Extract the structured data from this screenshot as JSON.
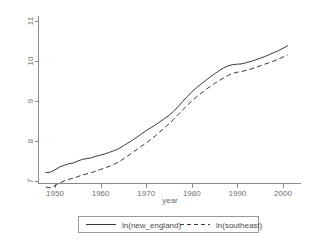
{
  "chart_data": {
    "type": "line",
    "title": "",
    "xlabel": "year",
    "ylabel": "",
    "xlim": [
      1948,
      2002
    ],
    "ylim": [
      6.6,
      11.2
    ],
    "xticks": [
      1950,
      1960,
      1970,
      1980,
      1990,
      2000
    ],
    "xtick_labels": [
      "1950",
      "1960",
      "1970",
      "1980",
      "1990",
      "2000"
    ],
    "yticks": [
      7,
      8,
      9,
      10,
      11
    ],
    "ytick_labels": [
      "7",
      "8",
      "9",
      "10",
      "11"
    ],
    "grid": false,
    "legend_position": "below-plot",
    "legend_entries": [
      {
        "label": "ln(new_england)",
        "style": "solid"
      },
      {
        "label": "ln(southeast)",
        "style": "dashed"
      }
    ],
    "x": [
      1948,
      1949,
      1950,
      1951,
      1952,
      1953,
      1954,
      1955,
      1956,
      1957,
      1958,
      1959,
      1960,
      1961,
      1962,
      1963,
      1964,
      1965,
      1966,
      1967,
      1968,
      1969,
      1970,
      1971,
      1972,
      1973,
      1974,
      1975,
      1976,
      1977,
      1978,
      1979,
      1980,
      1981,
      1982,
      1983,
      1984,
      1985,
      1986,
      1987,
      1988,
      1989,
      1990,
      1991,
      1992,
      1993,
      1994,
      1995,
      1996,
      1997,
      1998,
      1999,
      2000,
      2001
    ],
    "series": [
      {
        "name": "ln(new_england)",
        "style": "solid",
        "values": [
          7.21,
          7.22,
          7.28,
          7.35,
          7.39,
          7.43,
          7.45,
          7.5,
          7.54,
          7.56,
          7.58,
          7.62,
          7.65,
          7.68,
          7.72,
          7.76,
          7.81,
          7.88,
          7.95,
          8.02,
          8.1,
          8.18,
          8.26,
          8.33,
          8.4,
          8.48,
          8.56,
          8.64,
          8.74,
          8.86,
          8.99,
          9.11,
          9.23,
          9.33,
          9.42,
          9.51,
          9.6,
          9.68,
          9.76,
          9.83,
          9.88,
          9.91,
          9.92,
          9.93,
          9.96,
          9.99,
          10.03,
          10.07,
          10.11,
          10.16,
          10.21,
          10.26,
          10.32,
          10.38
        ]
      },
      {
        "name": "ln(southeast)",
        "style": "dashed",
        "values": [
          6.85,
          6.83,
          6.88,
          6.95,
          7.0,
          7.04,
          7.07,
          7.11,
          7.15,
          7.18,
          7.21,
          7.25,
          7.29,
          7.33,
          7.37,
          7.42,
          7.48,
          7.55,
          7.63,
          7.71,
          7.79,
          7.87,
          7.95,
          8.04,
          8.13,
          8.23,
          8.33,
          8.43,
          8.54,
          8.66,
          8.78,
          8.89,
          9.0,
          9.1,
          9.19,
          9.28,
          9.36,
          9.44,
          9.51,
          9.58,
          9.64,
          9.69,
          9.72,
          9.74,
          9.77,
          9.8,
          9.84,
          9.88,
          9.92,
          9.96,
          10.0,
          10.05,
          10.1,
          10.15
        ]
      }
    ]
  }
}
